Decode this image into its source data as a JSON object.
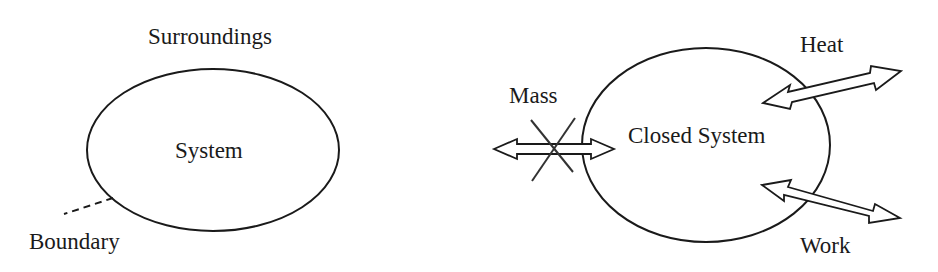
{
  "diagram": {
    "open_system": {
      "surroundings_label": "Surroundings",
      "system_label": "System",
      "boundary_label": "Boundary"
    },
    "closed_system": {
      "system_label": "Closed System",
      "exchanges": [
        {
          "label": "Mass",
          "allowed": false,
          "icon": "double-arrow-crossed-icon"
        },
        {
          "label": "Heat",
          "allowed": true,
          "icon": "double-arrow-icon"
        },
        {
          "label": "Work",
          "allowed": true,
          "icon": "double-arrow-icon"
        }
      ]
    },
    "colors": {
      "stroke": "#1a1a1a",
      "background": "#ffffff"
    }
  }
}
